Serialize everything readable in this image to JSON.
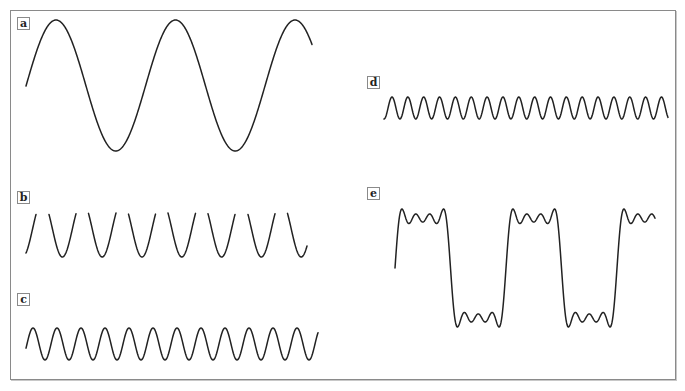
{
  "figure": {
    "panels": [
      {
        "id": "a",
        "label": "a"
      },
      {
        "id": "b",
        "label": "b"
      },
      {
        "id": "c",
        "label": "c"
      },
      {
        "id": "d",
        "label": "d"
      },
      {
        "id": "e",
        "label": "e"
      }
    ]
  },
  "chart_data": {
    "type": "line",
    "title": "",
    "grid": false,
    "axes": "none",
    "series": [
      {
        "name": "a",
        "description": "fundamental sine",
        "harmonic": 1,
        "x_start": 26,
        "x_end": 312,
        "period_px": 119.5,
        "center_y": 85.5,
        "amplitude_px": 65.5,
        "first_peak_x": 56,
        "clip_top": null
      },
      {
        "name": "b",
        "description": "3rd harmonic (drawn clipped at top)",
        "harmonic": 3,
        "x_start": 26,
        "x_end": 307,
        "period_px": 39.8,
        "center_y": 229,
        "amplitude_px": 28,
        "first_peak_x": 42.5,
        "clip_top": 213
      },
      {
        "name": "c",
        "description": "5th harmonic",
        "harmonic": 5,
        "x_start": 26,
        "x_end": 318,
        "period_px": 24.0,
        "center_y": 344,
        "amplitude_px": 16,
        "first_peak_x": 33,
        "clip_top": null
      },
      {
        "name": "d",
        "description": "7th harmonic",
        "harmonic": 7,
        "x_start": 384,
        "x_end": 668,
        "period_px": 15.85,
        "center_y": 108,
        "amplitude_px": 11,
        "first_peak_x": 392,
        "clip_top": null
      },
      {
        "name": "e",
        "description": "sum of harmonics 1,3,5,7 approximating a square wave",
        "harmonic": "sum",
        "terms": [
          1,
          3,
          5,
          7
        ],
        "x_start": 395,
        "x_end": 655,
        "period_px": 111,
        "center_y": 268,
        "amplitude_px": 59,
        "phase_start_x": 395,
        "clip_top": null
      }
    ]
  },
  "labels": {
    "a": {
      "text": "a",
      "x": 17,
      "y": 17
    },
    "b": {
      "text": "b",
      "x": 17,
      "y": 191
    },
    "c": {
      "text": "c",
      "x": 17,
      "y": 293
    },
    "d": {
      "text": "d",
      "x": 367,
      "y": 76
    },
    "e": {
      "text": "e",
      "x": 367,
      "y": 187
    }
  }
}
